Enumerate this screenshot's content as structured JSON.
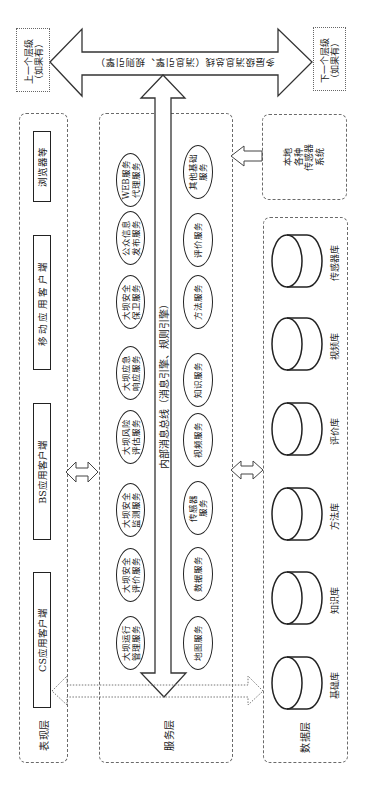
{
  "diagram": {
    "multilevel_bus": {
      "label": "多层级消息总线（消息引擎、规则引擎）"
    },
    "upper_level": {
      "line1": "上一个层级",
      "line2": "（如果有）"
    },
    "lower_level": {
      "line1": "下一个层级",
      "line2": "（如果有）"
    },
    "presentation_layer": {
      "label": "表现层",
      "clients": [
        {
          "label": "CS应用客户端"
        },
        {
          "label": "BS应用客户端"
        },
        {
          "label": "移动应用客户端"
        },
        {
          "label": "浏览器等"
        }
      ]
    },
    "service_layer": {
      "label": "服务层",
      "internal_bus_label": "内部消息总线（消息引擎、规则引擎）",
      "business_services": [
        {
          "line1": "大坝运行",
          "line2": "管理服务"
        },
        {
          "line1": "大坝安全",
          "line2": "评价服务"
        },
        {
          "line1": "大坝安全",
          "line2": "监测服务"
        },
        {
          "line1": "大坝风险",
          "line2": "评估服务"
        },
        {
          "line1": "大坝应急",
          "line2": "响应服务"
        },
        {
          "line1": "大坝安全",
          "line2": "保卫服务"
        },
        {
          "line1": "公众信息",
          "line2": "发布服务"
        },
        {
          "line1": "WEB服务",
          "line2": "代理服务"
        }
      ],
      "base_services": [
        {
          "line1": "地图服务"
        },
        {
          "line1": "数据服务"
        },
        {
          "line1": "传感器",
          "line2": "服务"
        },
        {
          "line1": "视频服务"
        },
        {
          "line1": "知识服务"
        },
        {
          "line1": "方法服务"
        },
        {
          "line1": "评价服务"
        },
        {
          "line1": "其他基础",
          "line2": "服务"
        }
      ]
    },
    "local_sensors": {
      "line1": "本地",
      "line2": "各种",
      "line3": "传感器",
      "line4": "系统"
    },
    "data_layer": {
      "label": "数据层",
      "databases": [
        {
          "label": "基础库"
        },
        {
          "label": "知识库"
        },
        {
          "label": "方法库"
        },
        {
          "label": "评价库"
        },
        {
          "label": "视频库"
        },
        {
          "label": "传感器库"
        }
      ]
    }
  }
}
